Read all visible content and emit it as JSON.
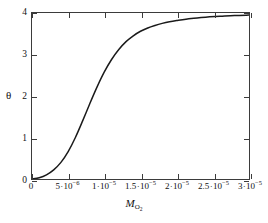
{
  "chart_data": {
    "type": "line",
    "title": "",
    "subtitle": "",
    "xlabel": "M_O2",
    "xlabel_base": "M",
    "xlabel_sub": "O",
    "xlabel_sub_sub": "2",
    "ylabel": "θ",
    "xlim": [
      0,
      3e-05
    ],
    "ylim": [
      0,
      4
    ],
    "grid": false,
    "legend": null,
    "x_ticks": [
      0,
      5e-06,
      1e-05,
      1.5e-05,
      2e-05,
      2.5e-05,
      3e-05
    ],
    "x_tick_labels": [
      {
        "mantissa": "0",
        "has_power": false,
        "exponent": ""
      },
      {
        "mantissa": "5",
        "has_power": true,
        "exponent": "-6"
      },
      {
        "mantissa": "1",
        "has_power": true,
        "exponent": "-5"
      },
      {
        "mantissa": "1.5",
        "has_power": true,
        "exponent": "-5"
      },
      {
        "mantissa": "2",
        "has_power": true,
        "exponent": "-5"
      },
      {
        "mantissa": "2.5",
        "has_power": true,
        "exponent": "-5"
      },
      {
        "mantissa": "3",
        "has_power": true,
        "exponent": "-5"
      }
    ],
    "y_ticks": [
      0,
      1,
      2,
      3,
      4
    ],
    "y_tick_labels": [
      "0",
      "1",
      "2",
      "3",
      "4"
    ],
    "series": [
      {
        "name": "theta",
        "color": "#1a1a1a",
        "x": [
          0.0,
          1e-06,
          2e-06,
          3e-06,
          4e-06,
          5e-06,
          6e-06,
          7e-06,
          8e-06,
          9e-06,
          1e-05,
          1.1e-05,
          1.2e-05,
          1.3e-05,
          1.4e-05,
          1.5e-05,
          1.6e-05,
          1.7e-05,
          1.8e-05,
          1.9e-05,
          2e-05,
          2.2e-05,
          2.4e-05,
          2.6e-05,
          2.8e-05,
          3e-05
        ],
        "y": [
          0.0,
          0.03,
          0.1,
          0.22,
          0.4,
          0.66,
          1.0,
          1.4,
          1.82,
          2.22,
          2.58,
          2.88,
          3.12,
          3.31,
          3.45,
          3.56,
          3.64,
          3.7,
          3.75,
          3.79,
          3.82,
          3.87,
          3.9,
          3.92,
          3.94,
          3.95
        ]
      }
    ]
  },
  "axis_title_x": "M",
  "axis_title_x_sub": "O",
  "axis_title_x_sub2": "2",
  "axis_title_y": "θ",
  "colors": {
    "curve": "#1a1a1a",
    "frame": "#3b3b3b",
    "background": "#ffffff",
    "text": "#111111"
  }
}
